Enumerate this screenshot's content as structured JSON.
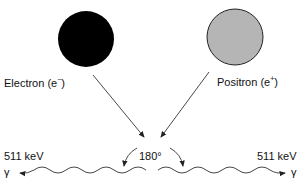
{
  "diagram": {
    "electron": {
      "label": "Electron (e",
      "charge": "−",
      "close": ")",
      "fill": "#000000"
    },
    "positron": {
      "label": "Positron (e",
      "charge": "+",
      "close": ")",
      "fill": "#b5b5b5"
    },
    "angle_label": "180°",
    "photon_left": {
      "energy": "511 keV",
      "symbol": "γ"
    },
    "photon_right": {
      "energy": "511 keV",
      "symbol": "γ"
    }
  }
}
